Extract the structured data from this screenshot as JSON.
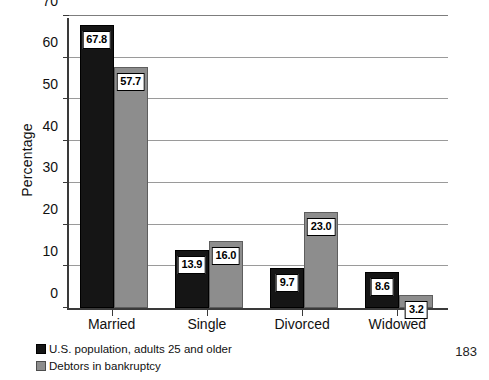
{
  "page_number": "183",
  "chart_data": {
    "type": "bar",
    "title": "",
    "xlabel": "",
    "ylabel": "Percentage",
    "categories": [
      "Married",
      "Single",
      "Divorced",
      "Widowed"
    ],
    "ylim": [
      0,
      70
    ],
    "yticks": [
      0,
      10,
      20,
      30,
      40,
      50,
      60,
      70
    ],
    "ytick_labels": [
      "0",
      "10",
      "20",
      "30",
      "40",
      "50",
      "60",
      "70"
    ],
    "grid": true,
    "grid_axis": "y",
    "legend_position": "below-axis-left",
    "series": [
      {
        "name": "U.S. population, adults 25 and older",
        "color": "#151515",
        "values": [
          67.8,
          13.9,
          9.7,
          8.6
        ],
        "value_labels": [
          "67.8",
          "13.9",
          "9.7",
          "8.6"
        ]
      },
      {
        "name": "Debtors in bankruptcy",
        "color": "#8d8d8d",
        "values": [
          57.7,
          16.0,
          23.0,
          3.2
        ],
        "value_labels": [
          "57.7",
          "16.0",
          "23.0",
          "3.2"
        ]
      }
    ]
  }
}
